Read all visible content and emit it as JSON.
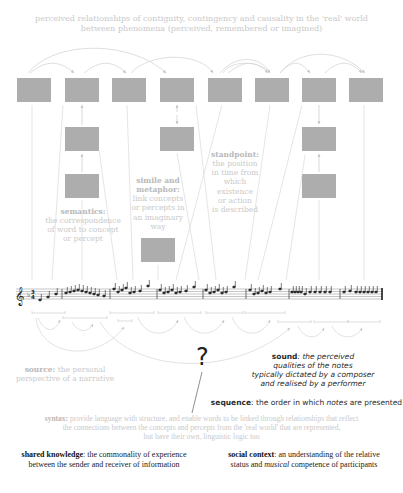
{
  "header": {
    "line1": "perceived relationships of contiguity, contingency and causality in the 'real' world",
    "line2": "between phenomena (perceived, remembered or imagined)"
  },
  "labels": {
    "semantics": {
      "term": "semantics:",
      "lines": [
        "the correspondence",
        "of word to concept",
        "or percept"
      ]
    },
    "simile": {
      "term1": "simile and",
      "term2": "metaphor:",
      "lines": [
        "link concepts",
        "or percepts in",
        "an imaginary",
        "way"
      ]
    },
    "standpoint": {
      "term": "standpoint:",
      "lines": [
        "the position",
        "in time from",
        "which",
        "existence",
        "or action",
        "is described"
      ]
    },
    "source": {
      "term": "source:",
      "line1_rest": " the personal",
      "line2": "perspective of a narrative"
    },
    "sound": {
      "term": "sound",
      "line1_rest": ": the perceived",
      "line2": "qualities of the notes",
      "line3": "typically dictated by a composer",
      "line4": "and realised by a performer"
    },
    "sequence": {
      "term": "sequence",
      "rest_before": ": the order in which ",
      "italic": "notes",
      "rest_after": " are presented"
    },
    "syntax": {
      "term": "syntax:",
      "line1_rest": " provide language with structure, and enable words to be linked through relationships that reflect",
      "line2": "the connections between the concepts and percepts from the 'real world' that are represented,",
      "line3": "but have their own, linguistic logic too"
    },
    "shared_knowledge": {
      "term": "shared knowledge",
      "line1_rest": ": the commonality of experience",
      "line2": "between the sender and receiver of information"
    },
    "social_context": {
      "term": "social context",
      "line1_rest": ": an understanding of the relative",
      "line2_before": "status and ",
      "line2_italic": "musical",
      "line2_after": " competence of participants"
    }
  },
  "question_mark": "?",
  "colors": {
    "box": "#adadad",
    "line": "#d4d4d4",
    "light_text": "#c6c6c6",
    "dark_text": "#222222"
  }
}
